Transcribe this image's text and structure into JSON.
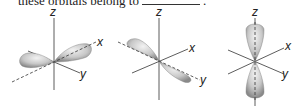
{
  "caption": {
    "text_before": "these orbitals belong to",
    "text_after": "."
  },
  "orbitals": [
    {
      "name": "p_x",
      "axis_labels": {
        "z": "z",
        "x": "x",
        "y": "y"
      },
      "lobe_axis": "x"
    },
    {
      "name": "p_y",
      "axis_labels": {
        "z": "z",
        "x": "x",
        "y": "y"
      },
      "lobe_axis": "y"
    },
    {
      "name": "p_z",
      "axis_labels": {
        "z": "z",
        "x": "x",
        "y": "y"
      },
      "lobe_axis": "z"
    }
  ],
  "colors": {
    "lobe_light": "#e6e6e6",
    "lobe_dark": "#8a8a8a",
    "axis": "#333333"
  }
}
